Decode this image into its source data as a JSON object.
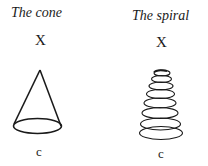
{
  "figures": [
    {
      "title": "The cone",
      "top_label": "X",
      "bottom_label": "c",
      "shape": "cone"
    },
    {
      "title": "The spiral",
      "top_label": "X",
      "bottom_label": "c",
      "shape": "conical-spiral"
    }
  ]
}
